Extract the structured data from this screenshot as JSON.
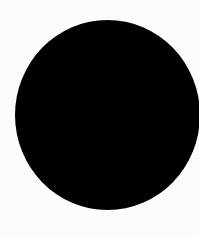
{
  "canvas": {
    "background_color": "#fcfcfc"
  },
  "shape": {
    "type": "circle",
    "fill_color": "#000000"
  }
}
